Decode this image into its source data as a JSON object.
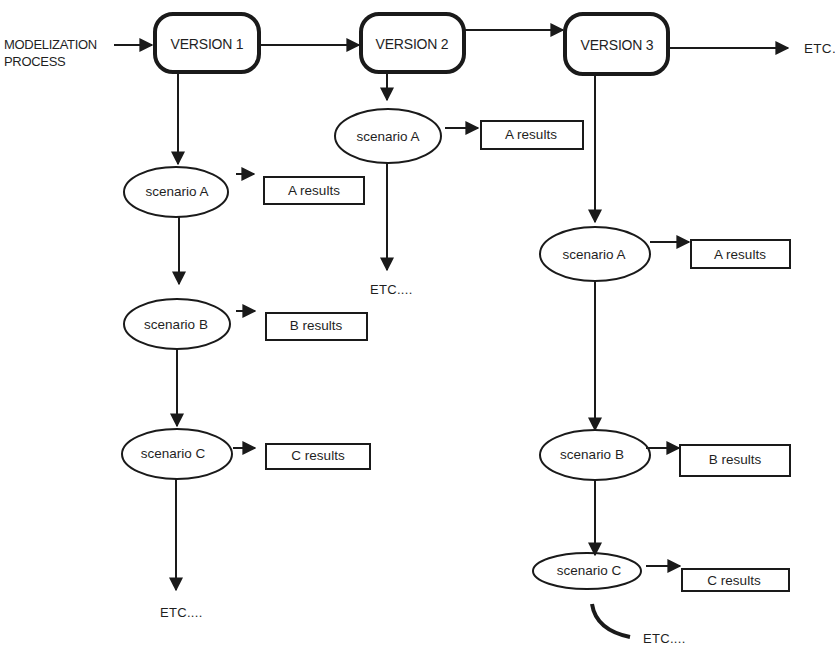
{
  "diagram": {
    "input_label": {
      "line1": "MODELIZATION",
      "line2": "PROCESS"
    },
    "versions": [
      {
        "label": "VERSION 1"
      },
      {
        "label": "VERSION 2"
      },
      {
        "label": "VERSION 3"
      }
    ],
    "trailing_etc": "ETC.",
    "columns": [
      {
        "version": "VERSION 1",
        "scenarios": [
          {
            "label": "scenario A",
            "result": "A results"
          },
          {
            "label": "scenario B",
            "result": "B results"
          },
          {
            "label": "scenario C",
            "result": "C results"
          }
        ],
        "etc": "ETC...."
      },
      {
        "version": "VERSION 2",
        "scenarios": [
          {
            "label": "scenario A",
            "result": "A results"
          }
        ],
        "etc": "ETC...."
      },
      {
        "version": "VERSION 3",
        "scenarios": [
          {
            "label": "scenario A",
            "result": "A results"
          },
          {
            "label": "scenario B",
            "result": "B results"
          },
          {
            "label": "scenario C",
            "result": "C results"
          }
        ],
        "etc": "ETC...."
      }
    ],
    "colors": {
      "ink": "#1a1a1a",
      "background": "#ffffff"
    }
  }
}
